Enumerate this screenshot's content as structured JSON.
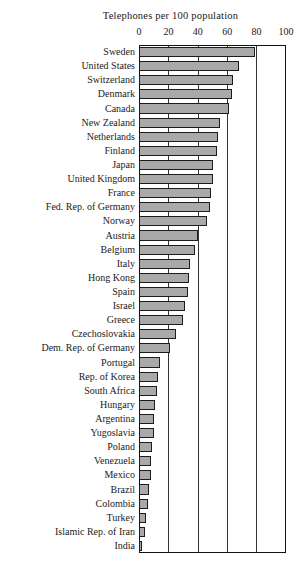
{
  "chart_data": {
    "type": "bar",
    "orientation": "horizontal",
    "title": "Telephones per 100 population",
    "xlabel": "",
    "ylabel": "",
    "xlim": [
      0,
      100
    ],
    "xticks": [
      0,
      20,
      40,
      60,
      80,
      100
    ],
    "xtick_labels": [
      "0",
      "20",
      "40",
      "60",
      "80",
      "100"
    ],
    "grid": true,
    "legend": "none",
    "bar_color": "#a9a9a9",
    "bar_edge_color": "#1c1c1c",
    "categories": [
      "Sweden",
      "United States",
      "Switzerland",
      "Denmark",
      "Canada",
      "New Zealand",
      "Netherlands",
      "Finland",
      "Japan",
      "United Kingdom",
      "France",
      "Fed. Rep. of Germany",
      "Norway",
      "Austria",
      "Belgium",
      "Italy",
      "Hong Kong",
      "Spain",
      "Israel",
      "Greece",
      "Czechoslovakia",
      "Dem. Rep. of Germany",
      "Portugal",
      "Rep. of Korea",
      "South Africa",
      "Hungary",
      "Argentina",
      "Yugoslavia",
      "Poland",
      "Venezuela",
      "Mexico",
      "Brazil",
      "Colombia",
      "Turkey",
      "Islamic Rep. of Iran",
      "India"
    ],
    "values": [
      79,
      68,
      64,
      63,
      61,
      55,
      54,
      53,
      50,
      50,
      49,
      48,
      46,
      40,
      38,
      35,
      34,
      33,
      31,
      30,
      25,
      21,
      14,
      13,
      12,
      11,
      10,
      10,
      9,
      8,
      8,
      7,
      6,
      5,
      4,
      1
    ]
  }
}
